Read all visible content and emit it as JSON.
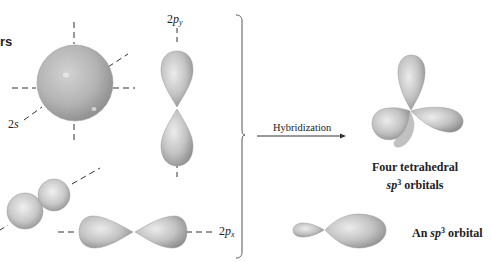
{
  "figure": {
    "left_title_fragment": "rs",
    "orbitals": {
      "s": {
        "label_prefix": "2",
        "label_italic": "s"
      },
      "py": {
        "label_prefix": "2",
        "label_italic": "p",
        "label_sub": "y"
      },
      "px": {
        "label_prefix": "2",
        "label_italic": "p",
        "label_sub": "x"
      },
      "pz": {
        "label_prefix": "",
        "label_italic": "",
        "label_sub": ""
      }
    },
    "arrow_label": "Hybridization",
    "result_four": {
      "line1": "Four tetrahedral",
      "line2_italic": "sp",
      "line2_sup": "3",
      "line2_rest": " orbitals"
    },
    "result_one": {
      "prefix": "An ",
      "italic": "sp",
      "sup": "3",
      "rest": " orbital"
    }
  },
  "colors": {
    "orbital_fill": "#b9b9b9",
    "orbital_highlight": "#e6e6e6",
    "orbital_shadow": "#8e8e8e",
    "axis_dash": "#333333",
    "bracket": "#555555",
    "text": "#1a1a1a"
  }
}
